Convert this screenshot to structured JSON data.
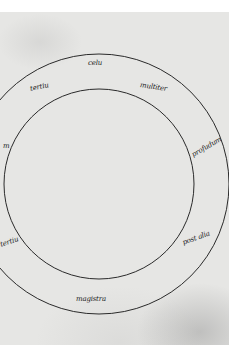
{
  "manuscript": {
    "description": "Two concentric circles with handwritten Latin labels in the ring between them",
    "colors": {
      "parchment": "#e6e6e4",
      "ink": "#2a2a2a",
      "margin": "#ffffff"
    },
    "circles": {
      "center": [
        99,
        184
      ],
      "outer_radius": 130,
      "inner_radius": 95
    },
    "labels": [
      {
        "id": "top",
        "text": "celu"
      },
      {
        "id": "upper-left",
        "text": "tertiu"
      },
      {
        "id": "upper-right",
        "text": "multiter"
      },
      {
        "id": "right",
        "text": "profudum"
      },
      {
        "id": "lower-right",
        "text": "post alia"
      },
      {
        "id": "bottom",
        "text": "magistra"
      },
      {
        "id": "left",
        "text": "m"
      },
      {
        "id": "lower-left",
        "text": "tertiu"
      }
    ]
  }
}
